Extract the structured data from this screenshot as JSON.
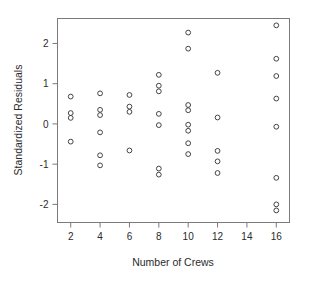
{
  "chart_data": {
    "type": "scatter",
    "title": "",
    "xlabel": "Number of Crews",
    "ylabel": "Standardized Residuals",
    "xlim": [
      1.1,
      16.9
    ],
    "ylim": [
      -2.45,
      2.62
    ],
    "xticks": [
      2,
      4,
      6,
      8,
      10,
      12,
      14,
      16
    ],
    "xtick_labels": [
      "2",
      "4",
      "6",
      "8",
      "10",
      "12",
      "14",
      "16"
    ],
    "yticks": [
      -2,
      -1,
      0,
      1,
      2
    ],
    "ytick_labels": [
      "-2",
      "-1",
      "0",
      "1",
      "2"
    ],
    "grid": false,
    "legend": null,
    "marker": "open-circle",
    "n_points": 42,
    "points": [
      {
        "x": 2,
        "y": 0.68
      },
      {
        "x": 2,
        "y": 0.27
      },
      {
        "x": 2,
        "y": 0.15
      },
      {
        "x": 2,
        "y": -0.44
      },
      {
        "x": 4,
        "y": 0.76
      },
      {
        "x": 4,
        "y": 0.35
      },
      {
        "x": 4,
        "y": 0.22
      },
      {
        "x": 4,
        "y": -0.21
      },
      {
        "x": 4,
        "y": -0.78
      },
      {
        "x": 4,
        "y": -1.03
      },
      {
        "x": 6,
        "y": 0.72
      },
      {
        "x": 6,
        "y": 0.43
      },
      {
        "x": 6,
        "y": 0.3
      },
      {
        "x": 6,
        "y": -0.66
      },
      {
        "x": 8,
        "y": 1.22
      },
      {
        "x": 8,
        "y": 0.95
      },
      {
        "x": 8,
        "y": 0.81
      },
      {
        "x": 8,
        "y": 0.25
      },
      {
        "x": 8,
        "y": -0.03
      },
      {
        "x": 8,
        "y": -1.11
      },
      {
        "x": 8,
        "y": -1.26
      },
      {
        "x": 10,
        "y": 2.27
      },
      {
        "x": 10,
        "y": 1.87
      },
      {
        "x": 10,
        "y": 0.47
      },
      {
        "x": 10,
        "y": 0.34
      },
      {
        "x": 10,
        "y": -0.02
      },
      {
        "x": 10,
        "y": -0.17
      },
      {
        "x": 10,
        "y": -0.48
      },
      {
        "x": 10,
        "y": -0.75
      },
      {
        "x": 12,
        "y": 1.27
      },
      {
        "x": 12,
        "y": 0.16
      },
      {
        "x": 12,
        "y": -0.67
      },
      {
        "x": 12,
        "y": -0.93
      },
      {
        "x": 12,
        "y": -1.22
      },
      {
        "x": 16,
        "y": 2.45
      },
      {
        "x": 16,
        "y": 1.62
      },
      {
        "x": 16,
        "y": 1.19
      },
      {
        "x": 16,
        "y": 0.63
      },
      {
        "x": 16,
        "y": -0.07
      },
      {
        "x": 16,
        "y": -1.34
      },
      {
        "x": 16,
        "y": -2.0
      },
      {
        "x": 16,
        "y": -2.15
      }
    ]
  }
}
